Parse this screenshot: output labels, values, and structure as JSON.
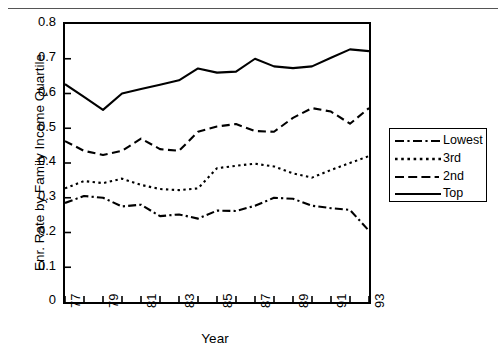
{
  "chart_data": {
    "type": "line",
    "title": "",
    "xlabel": "Year",
    "ylabel": "Enr. Rate by Family Income Quartile",
    "xlim": [
      77,
      93
    ],
    "ylim": [
      0,
      0.8
    ],
    "grid": false,
    "legend_position": "right",
    "x": [
      77,
      78,
      79,
      80,
      81,
      82,
      83,
      84,
      85,
      86,
      87,
      88,
      89,
      90,
      91,
      92,
      93
    ],
    "x_tick_labels": [
      "77",
      "79",
      "81",
      "83",
      "85",
      "87",
      "89",
      "91",
      "93"
    ],
    "y_tick_labels": [
      "0",
      "0.1",
      "0.2",
      "0.3",
      "0.4",
      "0.5",
      "0.6",
      "0.7",
      "0.8"
    ],
    "series": [
      {
        "name": "Lowest",
        "style": "dash-dot",
        "values": [
          0.285,
          0.305,
          0.3,
          0.275,
          0.28,
          0.247,
          0.252,
          0.24,
          0.263,
          0.262,
          0.277,
          0.3,
          0.297,
          0.277,
          0.27,
          0.265,
          0.205
        ]
      },
      {
        "name": "3rd",
        "style": "dotted",
        "values": [
          0.327,
          0.348,
          0.342,
          0.355,
          0.337,
          0.325,
          0.322,
          0.327,
          0.385,
          0.392,
          0.398,
          0.39,
          0.37,
          0.358,
          0.38,
          0.4,
          0.42
        ]
      },
      {
        "name": "2nd",
        "style": "dashed",
        "values": [
          0.463,
          0.435,
          0.423,
          0.435,
          0.47,
          0.44,
          0.435,
          0.49,
          0.505,
          0.512,
          0.492,
          0.49,
          0.53,
          0.558,
          0.548,
          0.513,
          0.558
        ]
      },
      {
        "name": "Top",
        "style": "solid",
        "values": [
          0.627,
          0.59,
          0.553,
          0.6,
          0.613,
          0.625,
          0.638,
          0.672,
          0.66,
          0.663,
          0.7,
          0.678,
          0.673,
          0.678,
          0.703,
          0.727,
          0.722
        ]
      }
    ]
  },
  "legend": {
    "items": [
      {
        "label": "Lowest"
      },
      {
        "label": "3rd"
      },
      {
        "label": "2nd"
      },
      {
        "label": "Top"
      }
    ]
  },
  "axes": {
    "x_title": "Year",
    "y_title": "Enr. Rate by Family Income Quartile"
  },
  "colors": {
    "line": "#000000",
    "axis": "#000000",
    "background": "#ffffff",
    "rule": "#555555"
  }
}
